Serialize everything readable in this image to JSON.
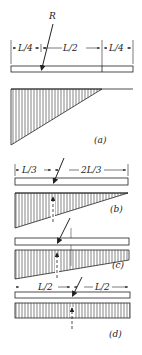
{
  "figure": {
    "panels": [
      {
        "id": "a",
        "caption": "(a)",
        "force_label": "R",
        "dimensions": [
          "L/4",
          "L/2",
          "L/4"
        ],
        "stress_shape": "triangle"
      },
      {
        "id": "b",
        "caption": "(b)",
        "dimensions": [
          "L/3",
          "2L/3"
        ],
        "stress_shape": "triangle-to-zero"
      },
      {
        "id": "c",
        "caption": "(c)",
        "stress_shape": "trapezoid"
      },
      {
        "id": "d",
        "caption": "(d)",
        "dimensions": [
          "L/2",
          "L/2"
        ],
        "stress_shape": "uniform"
      }
    ]
  },
  "colors": {
    "ink": "#222222",
    "background": "#ffffff"
  }
}
